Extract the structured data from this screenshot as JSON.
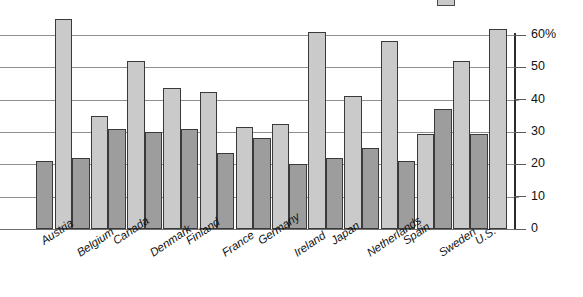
{
  "chart_data": {
    "type": "bar",
    "title": "",
    "subtitle": "",
    "xlabel": "",
    "ylabel": "",
    "ylim": [
      0,
      70
    ],
    "grid": true,
    "legend_position": "top-right",
    "categories": [
      "Austria",
      "Belgium",
      "Canada",
      "Denmark",
      "Finland",
      "France",
      "Germany",
      "Ireland",
      "Japan",
      "Netherlands",
      "Spain",
      "Sweden",
      "U.S."
    ],
    "ytick_values": [
      0,
      10,
      20,
      30,
      40,
      50,
      60
    ],
    "ytick_labels": [
      "0",
      "10",
      "20",
      "30",
      "40",
      "50",
      "60%"
    ],
    "series": [
      {
        "name": "series-1",
        "color": "#9d9d9d",
        "values": [
          21,
          22,
          31,
          30,
          31,
          23.5,
          28,
          20,
          22,
          25,
          21,
          37,
          29.5
        ]
      },
      {
        "name": "series-2",
        "color": "#cacaca",
        "values": [
          65,
          35,
          52,
          43.5,
          42.5,
          31.5,
          32.5,
          61,
          41,
          58,
          29.5,
          52,
          62
        ]
      }
    ],
    "legend_entries": [
      {
        "label": "",
        "color": "#c9c9c9"
      }
    ]
  },
  "axis": {
    "percent_suffix": "%"
  }
}
